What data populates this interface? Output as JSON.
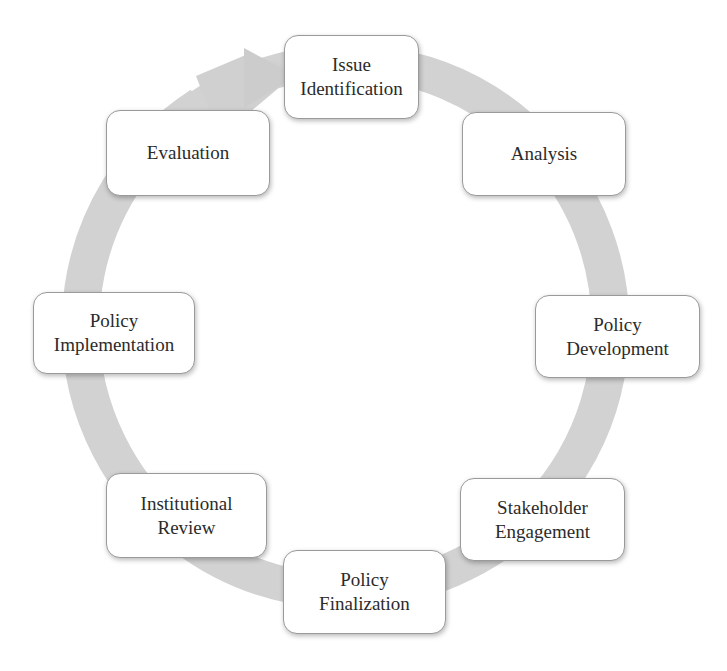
{
  "diagram": {
    "type": "cycle",
    "direction": "clockwise",
    "ring_color": "#cfcfcf",
    "nodes": [
      {
        "id": "issue-identification",
        "label": "Issue\nIdentification"
      },
      {
        "id": "analysis",
        "label": "Analysis"
      },
      {
        "id": "policy-development",
        "label": "Policy\nDevelopment"
      },
      {
        "id": "stakeholder-engagement",
        "label": "Stakeholder\nEngagement"
      },
      {
        "id": "policy-finalization",
        "label": "Policy\nFinalization"
      },
      {
        "id": "institutional-review",
        "label": "Institutional\nReview"
      },
      {
        "id": "policy-implementation",
        "label": "Policy\nImplementation"
      },
      {
        "id": "evaluation",
        "label": "Evaluation"
      }
    ],
    "edges": [
      {
        "from": "issue-identification",
        "to": "analysis"
      },
      {
        "from": "analysis",
        "to": "policy-development"
      },
      {
        "from": "policy-development",
        "to": "stakeholder-engagement"
      },
      {
        "from": "stakeholder-engagement",
        "to": "policy-finalization"
      },
      {
        "from": "policy-finalization",
        "to": "institutional-review"
      },
      {
        "from": "institutional-review",
        "to": "policy-implementation"
      },
      {
        "from": "policy-implementation",
        "to": "evaluation"
      },
      {
        "from": "evaluation",
        "to": "issue-identification"
      }
    ]
  }
}
